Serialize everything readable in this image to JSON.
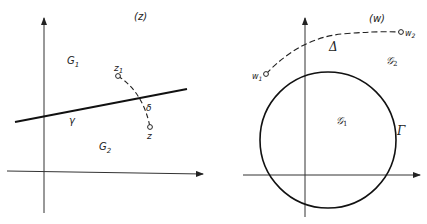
{
  "left_panel": {
    "plane_label": "(z)",
    "region_upper": "G",
    "region_upper_sub": "1",
    "region_lower": "G",
    "region_lower_sub": "2",
    "curve_label": "γ",
    "path_label": "δ",
    "point_start": "z",
    "point_start_sub": "1",
    "point_end": "z"
  },
  "right_panel": {
    "plane_label": "(w)",
    "region_outside": "𝒢",
    "region_outside_sub": "2",
    "region_inside": "𝒢",
    "region_inside_sub": "1",
    "circle_label": "Γ",
    "path_label": "Δ",
    "point_start": "w",
    "point_start_sub": "1",
    "point_end": "w",
    "point_end_sub": "2"
  },
  "colors": {
    "ink": "#222222",
    "background": "#ffffff"
  }
}
